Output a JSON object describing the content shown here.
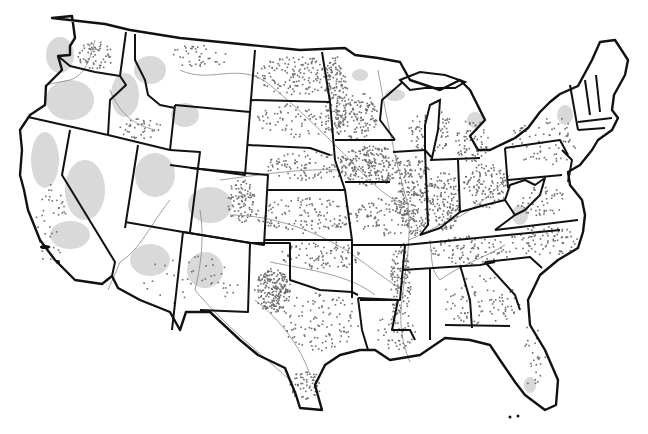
{
  "map": {
    "subject": "Contiguous United States",
    "style": "grayscale dot-density map with state boundaries and rivers",
    "colors": {
      "background": "#ffffff",
      "boundary": "#111111",
      "shaded_area": "#d9d9d9",
      "dot": "#6e6e6e",
      "river": "#888888"
    },
    "dot_clusters": [
      {
        "region": "eastern-washington",
        "cx": 95,
        "cy": 55,
        "rx": 18,
        "ry": 14,
        "n": 60
      },
      {
        "region": "montana-north",
        "cx": 200,
        "cy": 55,
        "rx": 30,
        "ry": 12,
        "n": 40
      },
      {
        "region": "southern-idaho",
        "cx": 140,
        "cy": 128,
        "rx": 22,
        "ry": 10,
        "n": 35
      },
      {
        "region": "north-dakota",
        "cx": 300,
        "cy": 75,
        "rx": 45,
        "ry": 20,
        "n": 160
      },
      {
        "region": "south-dakota",
        "cx": 300,
        "cy": 120,
        "rx": 45,
        "ry": 18,
        "n": 90
      },
      {
        "region": "red-river-valley",
        "cx": 335,
        "cy": 95,
        "rx": 12,
        "ry": 40,
        "n": 120
      },
      {
        "region": "minnesota-southwest",
        "cx": 355,
        "cy": 115,
        "rx": 22,
        "ry": 25,
        "n": 130
      },
      {
        "region": "iowa",
        "cx": 370,
        "cy": 165,
        "rx": 32,
        "ry": 20,
        "n": 220
      },
      {
        "region": "nebraska",
        "cx": 310,
        "cy": 165,
        "rx": 45,
        "ry": 15,
        "n": 110
      },
      {
        "region": "kansas",
        "cx": 305,
        "cy": 215,
        "rx": 50,
        "ry": 18,
        "n": 130
      },
      {
        "region": "eastern-colorado",
        "cx": 240,
        "cy": 200,
        "rx": 14,
        "ry": 22,
        "n": 90
      },
      {
        "region": "missouri",
        "cx": 385,
        "cy": 215,
        "rx": 30,
        "ry": 20,
        "n": 110
      },
      {
        "region": "illinois",
        "cx": 415,
        "cy": 195,
        "rx": 18,
        "ry": 40,
        "n": 220
      },
      {
        "region": "indiana",
        "cx": 445,
        "cy": 200,
        "rx": 14,
        "ry": 30,
        "n": 130
      },
      {
        "region": "ohio",
        "cx": 485,
        "cy": 185,
        "rx": 22,
        "ry": 22,
        "n": 120
      },
      {
        "region": "wisconsin",
        "cx": 430,
        "cy": 130,
        "rx": 22,
        "ry": 22,
        "n": 90
      },
      {
        "region": "michigan",
        "cx": 470,
        "cy": 140,
        "rx": 18,
        "ry": 22,
        "n": 70
      },
      {
        "region": "texas-panhandle-south-plains",
        "cx": 272,
        "cy": 290,
        "rx": 18,
        "ry": 22,
        "n": 220
      },
      {
        "region": "central-texas",
        "cx": 320,
        "cy": 320,
        "rx": 40,
        "ry": 30,
        "n": 110
      },
      {
        "region": "south-texas-coast",
        "cx": 305,
        "cy": 385,
        "rx": 16,
        "ry": 15,
        "n": 60
      },
      {
        "region": "oklahoma",
        "cx": 320,
        "cy": 255,
        "rx": 40,
        "ry": 15,
        "n": 90
      },
      {
        "region": "mississippi-delta",
        "cx": 400,
        "cy": 280,
        "rx": 10,
        "ry": 40,
        "n": 120
      },
      {
        "region": "kentucky-tennessee",
        "cx": 470,
        "cy": 250,
        "rx": 40,
        "ry": 15,
        "n": 90
      },
      {
        "region": "north-carolina",
        "cx": 545,
        "cy": 240,
        "rx": 35,
        "ry": 15,
        "n": 80
      },
      {
        "region": "georgia-alabama",
        "cx": 480,
        "cy": 300,
        "rx": 40,
        "ry": 25,
        "n": 90
      },
      {
        "region": "pennsylvania-new-york",
        "cx": 545,
        "cy": 140,
        "rx": 35,
        "ry": 25,
        "n": 70
      },
      {
        "region": "virginia",
        "cx": 540,
        "cy": 200,
        "rx": 25,
        "ry": 15,
        "n": 50
      },
      {
        "region": "california-valley",
        "cx": 50,
        "cy": 220,
        "rx": 15,
        "ry": 45,
        "n": 40
      },
      {
        "region": "arizona-new-mexico",
        "cx": 190,
        "cy": 280,
        "rx": 50,
        "ry": 25,
        "n": 40
      },
      {
        "region": "florida",
        "cx": 530,
        "cy": 355,
        "rx": 15,
        "ry": 30,
        "n": 25
      },
      {
        "region": "louisiana",
        "cx": 395,
        "cy": 330,
        "rx": 20,
        "ry": 20,
        "n": 50
      }
    ]
  }
}
